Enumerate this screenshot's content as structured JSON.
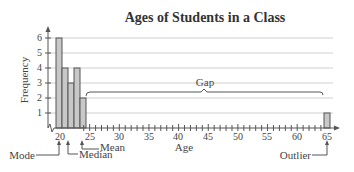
{
  "chart_data": {
    "type": "bar",
    "title": "Ages of Students in a Class",
    "xlabel": "Age",
    "ylabel": "Frequency",
    "x": [
      19,
      20,
      21,
      22,
      23,
      65
    ],
    "values": [
      6,
      4,
      3,
      4,
      2,
      1
    ],
    "xlim": [
      18,
      66
    ],
    "ylim": [
      0,
      6
    ],
    "x_ticks": [
      20,
      25,
      30,
      35,
      40,
      45,
      50,
      55,
      60,
      65
    ],
    "y_ticks": [
      1,
      2,
      3,
      4,
      5,
      6
    ],
    "grid": "horizontal",
    "legend": "none",
    "bar_color": "#c8c8c8",
    "annotations": [
      {
        "label": "Mode",
        "x": 19
      },
      {
        "label": "Median",
        "x": 21
      },
      {
        "label": "Mean",
        "x": 23.6
      },
      {
        "label": "Gap",
        "x_range": [
          24,
          64
        ]
      },
      {
        "label": "Outlier",
        "x": 65
      }
    ]
  },
  "labels": {
    "title": "Ages of Students in a Class",
    "xlabel": "Age",
    "ylabel": "Frequency",
    "mode": "Mode",
    "median": "Median",
    "mean": "Mean",
    "gap": "Gap",
    "outlier": "Outlier"
  }
}
